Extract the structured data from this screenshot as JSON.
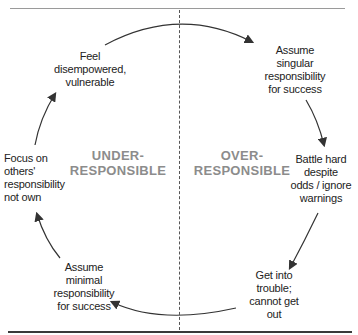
{
  "diagram": {
    "zones": {
      "left": {
        "line1": "UNDER-",
        "line2": "RESPONSIBLE"
      },
      "right": {
        "line1": "OVER-",
        "line2": "RESPONSIBLE"
      }
    },
    "nodes": [
      {
        "id": "feel",
        "lines": [
          "Feel",
          "disempowered,",
          "vulnerable"
        ]
      },
      {
        "id": "assume-singular",
        "lines": [
          "Assume",
          "singular",
          "responsibility",
          "for success"
        ]
      },
      {
        "id": "battle",
        "lines": [
          "Battle hard",
          "despite",
          "odds / ignore",
          "warnings"
        ]
      },
      {
        "id": "trouble",
        "lines": [
          "Get into",
          "trouble;",
          "cannot get",
          "out"
        ]
      },
      {
        "id": "assume-minimal",
        "lines": [
          "Assume",
          "minimal",
          "responsibility",
          "for success"
        ]
      },
      {
        "id": "focus",
        "lines": [
          "Focus on",
          "others'",
          "responsibility",
          "not own"
        ]
      }
    ],
    "colors": {
      "arrow": "#333333",
      "zone_label": "#8c8c8c",
      "divider": "#555555"
    }
  }
}
